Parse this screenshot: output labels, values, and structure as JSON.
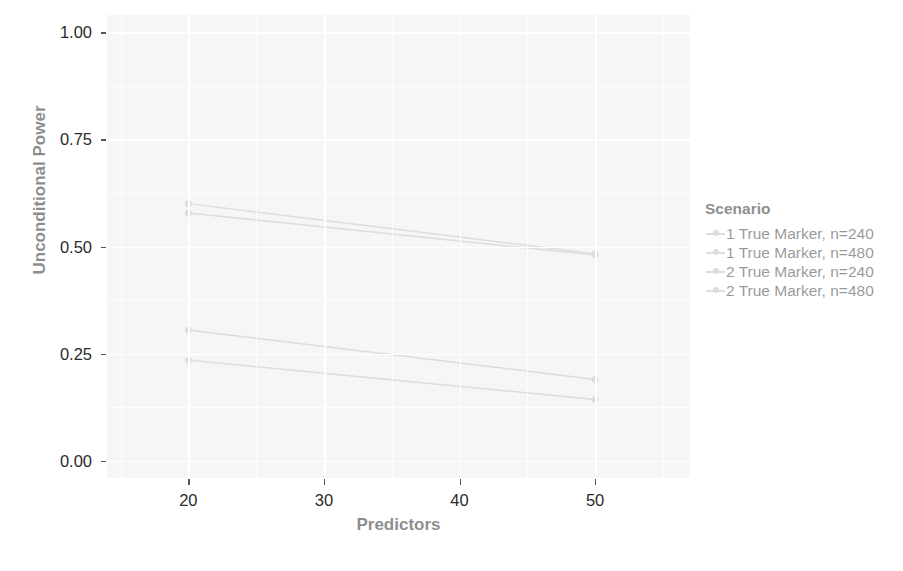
{
  "chart_data": {
    "type": "line",
    "title": "",
    "xlabel": "Predictors",
    "ylabel": "Unconditional Power",
    "xlim": [
      14,
      57
    ],
    "ylim": [
      -0.04,
      1.04
    ],
    "x": [
      20,
      50
    ],
    "xticks": [
      20,
      30,
      40,
      50
    ],
    "xticklabels": [
      "20",
      "30",
      "40",
      "50"
    ],
    "yticks": [
      0.0,
      0.25,
      0.5,
      0.75,
      1.0
    ],
    "yticklabels": [
      "0.00",
      "0.25",
      "0.50",
      "0.75",
      "1.00"
    ],
    "grid": true,
    "legend_position": "right",
    "legend_title": "Scenario",
    "series": [
      {
        "name": "1 True Marker, n=240",
        "values": [
          0.305,
          0.19
        ],
        "color": "#b9b0ac"
      },
      {
        "name": "1 True Marker, n=480",
        "values": [
          0.6,
          0.483
        ],
        "color": "#b4b4ad"
      },
      {
        "name": "2 True Marker, n=240",
        "values": [
          0.235,
          0.143
        ],
        "color": "#aeb6b6"
      },
      {
        "name": "2 True Marker, n=480",
        "values": [
          0.578,
          0.48
        ],
        "color": "#b2b3bb"
      }
    ]
  },
  "panel": {
    "background_color": "#ebebeb",
    "gridline_color": "#ffffff"
  }
}
